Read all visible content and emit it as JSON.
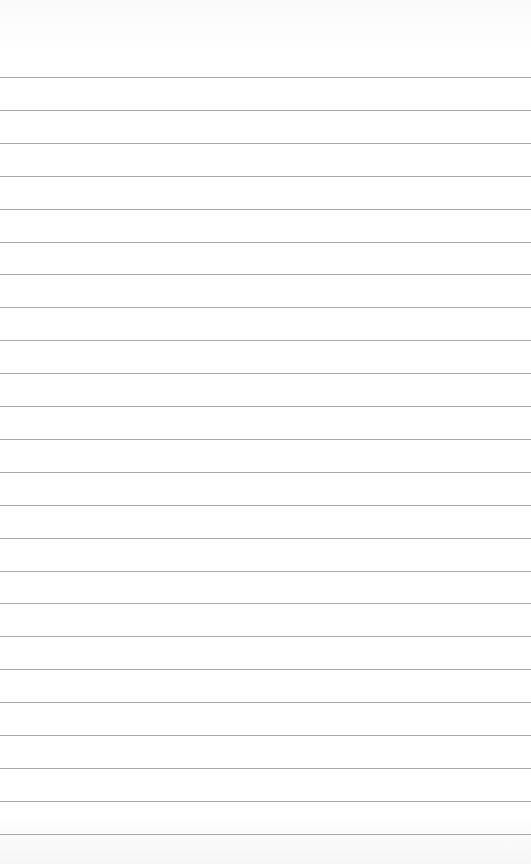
{
  "paper": {
    "background": "#fdfdfd",
    "rule_color": "#a9a9a9",
    "first_rule_y": 77,
    "rule_spacing": 32.9,
    "rule_count": 24
  }
}
